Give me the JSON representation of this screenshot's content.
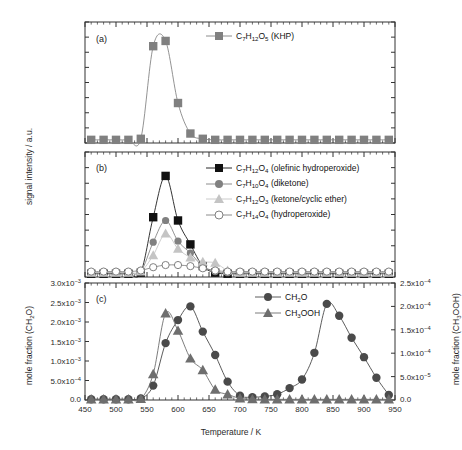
{
  "figure": {
    "xlabel": "Temperature / K",
    "left_axis_label_ab": "signal intensity / a.u.",
    "left_axis_label_c": "mole fraction (CH2O)",
    "right_axis_label_c": "mole fraction (CH3OOH)",
    "panel_tags": [
      "(a)",
      "(b)",
      "(c)"
    ],
    "xticks": [
      450,
      500,
      550,
      600,
      650,
      700,
      750,
      800,
      850,
      900,
      950
    ],
    "xlim": [
      450,
      950
    ],
    "colors": {
      "black": "#111111",
      "dark_gray": "#4a4a4a",
      "mid_gray": "#808080",
      "light_gray": "#c4c4c4",
      "axis": "#333333"
    }
  },
  "chart_data": [
    {
      "type": "line",
      "panel": "(a)",
      "title": "",
      "xlabel": "",
      "ylabel": "signal intensity / a.u.",
      "xlim": [
        450,
        950
      ],
      "ylim": [
        0,
        1.15
      ],
      "grid": false,
      "legend_position": "top-center",
      "series": [
        {
          "name": "C7H12O5 (KHP)",
          "label_html": "C<sub>7</sub>H<sub>12</sub>O<sub>5</sub> (KHP)",
          "marker": "square",
          "color": "#808080",
          "x": [
            460,
            480,
            500,
            520,
            540,
            560,
            580,
            600,
            620,
            640,
            660,
            680,
            700,
            720,
            740,
            760,
            780,
            800,
            820,
            840,
            860,
            880,
            900,
            920,
            940
          ],
          "y": [
            0.03,
            0.03,
            0.03,
            0.03,
            0.04,
            0.92,
            0.97,
            0.38,
            0.09,
            0.04,
            0.03,
            0.03,
            0.03,
            0.03,
            0.03,
            0.03,
            0.03,
            0.03,
            0.03,
            0.03,
            0.03,
            0.03,
            0.03,
            0.03,
            0.03
          ]
        }
      ]
    },
    {
      "type": "line",
      "panel": "(b)",
      "title": "",
      "xlabel": "",
      "ylabel": "signal intensity / a.u.",
      "xlim": [
        450,
        950
      ],
      "ylim": [
        0,
        1.15
      ],
      "grid": false,
      "legend_position": "top-right",
      "series": [
        {
          "name": "C7H12O4 (olefinic hydroperoxide)",
          "label_html": "C<sub>7</sub>H<sub>12</sub>O<sub>4</sub> (olefinic hydroperoxide)",
          "marker": "square",
          "color": "#111111",
          "x": [
            460,
            480,
            500,
            520,
            540,
            560,
            580,
            600,
            620,
            640,
            660,
            680,
            700,
            720,
            740,
            760,
            780,
            800,
            820,
            840,
            860,
            880,
            900,
            920,
            940
          ],
          "y": [
            0.03,
            0.03,
            0.03,
            0.03,
            0.04,
            0.55,
            0.93,
            0.52,
            0.3,
            0.1,
            0.04,
            0.03,
            0.03,
            0.03,
            0.03,
            0.03,
            0.03,
            0.03,
            0.03,
            0.03,
            0.03,
            0.03,
            0.03,
            0.03,
            0.03
          ]
        },
        {
          "name": "C7H10O4 (diketone)",
          "label_html": "C<sub>7</sub>H<sub>10</sub>O<sub>4</sub> (diketone)",
          "marker": "circle",
          "color": "#808080",
          "x": [
            460,
            480,
            500,
            520,
            540,
            560,
            580,
            600,
            620,
            640,
            660,
            680,
            700,
            720,
            740,
            760,
            780,
            800,
            820,
            840,
            860,
            880,
            900,
            920,
            940
          ],
          "y": [
            0.04,
            0.04,
            0.04,
            0.04,
            0.05,
            0.32,
            0.52,
            0.33,
            0.22,
            0.1,
            0.05,
            0.04,
            0.04,
            0.04,
            0.04,
            0.04,
            0.04,
            0.04,
            0.04,
            0.04,
            0.04,
            0.04,
            0.04,
            0.04,
            0.04
          ]
        },
        {
          "name": "C7H12O3 (ketone/cyclic ether)",
          "label_html": "C<sub>7</sub>H<sub>12</sub>O<sub>3</sub> (ketone/cyclic ether)",
          "marker": "triangle",
          "color": "#c4c4c4",
          "x": [
            460,
            480,
            500,
            520,
            540,
            560,
            580,
            600,
            620,
            640,
            660,
            680,
            700,
            720,
            740,
            760,
            780,
            800,
            820,
            840,
            860,
            880,
            900,
            920,
            940
          ],
          "y": [
            0.04,
            0.04,
            0.04,
            0.04,
            0.05,
            0.2,
            0.4,
            0.26,
            0.18,
            0.14,
            0.13,
            0.06,
            0.04,
            0.04,
            0.04,
            0.04,
            0.04,
            0.04,
            0.04,
            0.04,
            0.04,
            0.04,
            0.04,
            0.04,
            0.04
          ]
        },
        {
          "name": "C7H14O4 (hydroperoxide)",
          "label_html": "C<sub>7</sub>H<sub>14</sub>O<sub>4</sub> (hydroperoxide)",
          "marker": "open-circle",
          "color": "#808080",
          "x": [
            460,
            480,
            500,
            520,
            540,
            560,
            580,
            600,
            620,
            640,
            660,
            680,
            700,
            720,
            740,
            760,
            780,
            800,
            820,
            840,
            860,
            880,
            900,
            920,
            940
          ],
          "y": [
            0.05,
            0.05,
            0.05,
            0.05,
            0.06,
            0.09,
            0.11,
            0.11,
            0.1,
            0.08,
            0.06,
            0.05,
            0.05,
            0.05,
            0.05,
            0.05,
            0.05,
            0.05,
            0.05,
            0.05,
            0.05,
            0.05,
            0.05,
            0.05,
            0.05
          ]
        }
      ]
    },
    {
      "type": "line",
      "panel": "(c)",
      "title": "",
      "xlabel": "Temperature / K",
      "ylabel": "mole fraction (CH2O)",
      "y2label": "mole fraction (CH3OOH)",
      "xlim": [
        450,
        950
      ],
      "ylim": [
        0,
        0.00325
      ],
      "y2lim": [
        0,
        0.00027
      ],
      "yticks": [
        0,
        0.0005,
        0.001,
        0.0015,
        0.002,
        0.0025,
        0.003
      ],
      "ytick_labels": [
        "0.0",
        "5.0x10-4",
        "1.0x10-3",
        "1.5x10-3",
        "2.0x10-3",
        "2.5x10-3",
        "3.0x10-3"
      ],
      "y2ticks": [
        0,
        5e-05,
        0.0001,
        0.00015,
        0.0002,
        0.00025
      ],
      "y2tick_labels": [
        "0.0",
        "5.0x10-5",
        "1.0x10-4",
        "1.5x10-4",
        "2.0x10-4",
        "2.5x10-4"
      ],
      "grid": false,
      "legend_position": "top-center",
      "series": [
        {
          "name": "CH2O",
          "label_html": "CH<sub>2</sub>O",
          "marker": "circle",
          "color": "#4a4a4a",
          "axis": "left",
          "x": [
            460,
            480,
            500,
            520,
            540,
            560,
            580,
            600,
            620,
            640,
            660,
            680,
            700,
            720,
            740,
            760,
            780,
            800,
            820,
            840,
            860,
            880,
            900,
            920,
            940
          ],
          "y": [
            2e-05,
            2e-05,
            2e-05,
            2e-05,
            4e-05,
            0.0004,
            0.00158,
            0.00222,
            0.0026,
            0.0019,
            0.00125,
            0.00051,
            0.00012,
            8e-05,
            0.0001,
            0.00016,
            0.00033,
            0.00057,
            0.00131,
            0.00267,
            0.00234,
            0.00173,
            0.00119,
            0.00062,
            0.00014
          ]
        },
        {
          "name": "CH3OOH",
          "label_html": "CH<sub>3</sub>OOH",
          "marker": "triangle",
          "color": "#6e6e6e",
          "axis": "right",
          "x": [
            460,
            480,
            500,
            520,
            540,
            560,
            580,
            600,
            620,
            640,
            660,
            680,
            700,
            720,
            740,
            760,
            780,
            800,
            820,
            840,
            860,
            880,
            900,
            920,
            940
          ],
          "y": [
            1.5e-06,
            1.5e-06,
            1.5e-06,
            1.5e-06,
            2.5e-06,
            6e-05,
            0.0002,
            0.00016,
            9.6e-05,
            6.9e-05,
            2.4e-05,
            1.3e-05,
            4e-06,
            2e-06,
            1.5e-06,
            1.5e-06,
            1.5e-06,
            1.5e-06,
            1.5e-06,
            1.5e-06,
            1.5e-06,
            1.5e-06,
            1.5e-06,
            1.5e-06,
            1.5e-06
          ]
        }
      ]
    }
  ]
}
